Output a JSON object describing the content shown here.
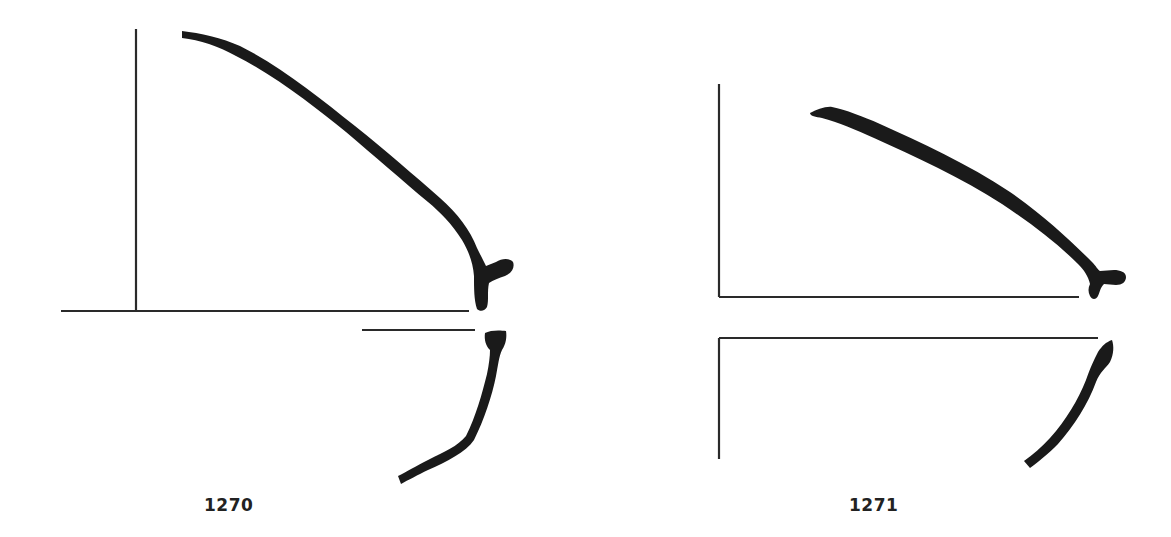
{
  "figures": [
    {
      "id": "1270",
      "label": "1270",
      "description": "Profile drawing: axis lines with a thick curved profile descending to a rim/foot detail, and a lower lower-section curve"
    },
    {
      "id": "1271",
      "label": "1271",
      "description": "Profile drawing: axis lines with a thick curved profile descending to a rim/foot detail, and a lower section curve"
    }
  ],
  "colors": {
    "ink": "#1a1a1a",
    "line": "#2a2a2a",
    "background": "#ffffff"
  }
}
